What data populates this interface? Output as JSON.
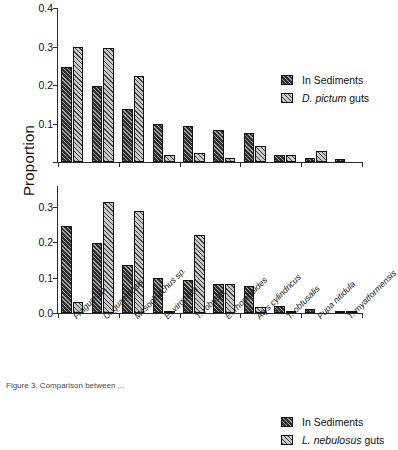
{
  "figure": {
    "ylabel": "Proportion",
    "caption": "Figure 3.  Comparison between ..."
  },
  "chart_data": {
    "type": "bar",
    "title": "",
    "xlabel": "",
    "ylabel": "Proportion",
    "grid": false,
    "legend_position": "upper-right-inside",
    "categories": [
      "Fragum sp.",
      "U. guamensis",
      "Mesoclanchus sp.",
      "E. virgulata",
      "T. robusta",
      "E. rhomboides",
      "Atys cylindricus",
      "T. obtusalis",
      "Pupa nitidula",
      "T. myatformensis"
    ],
    "panels": [
      {
        "id": "top",
        "ylim": [
          0,
          0.4
        ],
        "yticks": [
          0.0,
          0.1,
          0.2,
          0.3,
          0.4
        ],
        "ytick_labels": [
          "",
          "0.1",
          "0.2",
          "0.3",
          "0.4"
        ],
        "series": [
          {
            "name": "In Sediments",
            "values": [
              0.247,
              0.198,
              0.137,
              0.1,
              0.093,
              0.082,
              0.076,
              0.019,
              0.01,
              0.007
            ]
          },
          {
            "name": "D. pictum guts",
            "values": [
              0.3,
              0.295,
              0.224,
              0.017,
              0.023,
              0.011,
              0.042,
              0.019,
              0.028,
              0.0
            ]
          }
        ]
      },
      {
        "id": "bottom",
        "ylim": [
          0,
          0.36
        ],
        "yticks": [
          0.0,
          0.1,
          0.2,
          0.3
        ],
        "ytick_labels": [
          "0.0",
          "0.1",
          "0.2",
          "0.3"
        ],
        "series": [
          {
            "name": "In Sediments",
            "values": [
              0.247,
              0.198,
              0.137,
              0.1,
              0.093,
              0.082,
              0.076,
              0.019,
              0.01,
              0.006
            ]
          },
          {
            "name": "L. nebulosus guts",
            "values": [
              0.031,
              0.315,
              0.288,
              0.006,
              0.221,
              0.081,
              0.018,
              0.003,
              0.0,
              0.002
            ]
          }
        ]
      }
    ]
  },
  "legends": {
    "top": [
      {
        "label": "In Sediments",
        "italic_prefix": "",
        "pattern": "sed"
      },
      {
        "label": "guts",
        "italic_prefix": "D. pictum",
        "pattern": "gut"
      }
    ],
    "bottom": [
      {
        "label": "In Sediments",
        "italic_prefix": "",
        "pattern": "sed"
      },
      {
        "label": "guts",
        "italic_prefix": "L. nebulosus",
        "pattern": "gut"
      }
    ]
  }
}
